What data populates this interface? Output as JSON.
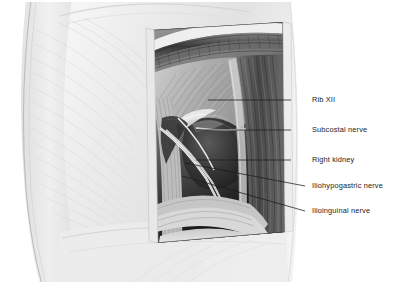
{
  "figure": {
    "modality": "medical-illustration-grayscale",
    "background_color": "#ffffff",
    "line_color": "#1b1b1b",
    "text_color": "#1b1b1b"
  },
  "labels": [
    {
      "id": "rib-xii",
      "text": "Rib XII",
      "text_x": 312,
      "text_y": 100,
      "leader": {
        "x1": 291,
        "y1": 100,
        "x2": 208,
        "y2": 100,
        "bend_x": null,
        "bend_y": null
      }
    },
    {
      "id": "subcostal-nerve",
      "text": "Subcostal nerve",
      "text_x": 312,
      "text_y": 130,
      "leader": {
        "x1": 291,
        "y1": 130,
        "x2": 196,
        "y2": 130,
        "bend_x": null,
        "bend_y": null
      }
    },
    {
      "id": "right-kidney",
      "text": "Right kidney",
      "text_x": 312,
      "text_y": 160,
      "leader": {
        "x1": 291,
        "y1": 160,
        "x2": 196,
        "y2": 160,
        "bend_x": null,
        "bend_y": null
      }
    },
    {
      "id": "iliohypogastric-nerve",
      "text": "Iliohypogastric nerve",
      "text_x": 312,
      "text_y": 186,
      "leader": {
        "x1": 305,
        "y1": 186,
        "x2": 185,
        "y2": 163,
        "bend_x": null,
        "bend_y": null
      }
    },
    {
      "id": "ilioinguinal-nerve",
      "text": "Ilioinguinal nerve",
      "text_x": 312,
      "text_y": 211,
      "leader": {
        "x1": 305,
        "y1": 211,
        "x2": 182,
        "y2": 176,
        "bend_x": null,
        "bend_y": null
      }
    }
  ],
  "regions": [
    {
      "id": "torso",
      "description": "pale gray trunk, flank and back, subtle muscle striations"
    },
    {
      "id": "dissection-window",
      "description": "rectangular cut-away over right flank exposing deep structures"
    },
    {
      "id": "costal-arch",
      "description": "dark arching rib band across top of window"
    },
    {
      "id": "kidney-mass",
      "description": "dark rounded right kidney in mid window"
    },
    {
      "id": "nerve-strands",
      "description": "pale slender nerves crossing the kidney diagonally"
    },
    {
      "id": "iliac-crest",
      "description": "pale fascia and crest band at window base"
    }
  ]
}
